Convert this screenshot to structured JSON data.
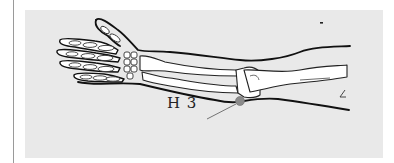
{
  "figure": {
    "point_label": "H 3",
    "point_marker": {
      "cx": 240,
      "cy": 101,
      "r": 4.5,
      "color": "#8a8a8a"
    },
    "panel_color": "#e9e9e9",
    "outline_color": "#111111",
    "bone_fill": "#ffffff"
  }
}
